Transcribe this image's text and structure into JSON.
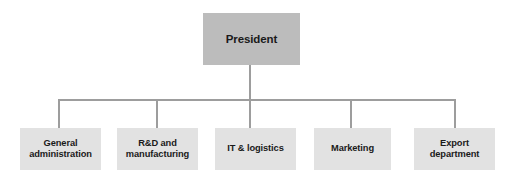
{
  "chart": {
    "type": "org-chart",
    "title": "",
    "background_color": "#ffffff",
    "line_color": "#9d9d9d",
    "root": {
      "id": "president",
      "label": "President",
      "fill_color": "#bcbcbc",
      "text_color": "#1a1a1a"
    },
    "departments": [
      {
        "id": "general-administration",
        "label": "General\nadministration",
        "fill_color": "#e2e2e2",
        "text_color": "#1a1a1a"
      },
      {
        "id": "rd-and-manufacturing",
        "label": "R&D and\nmanufacturing",
        "fill_color": "#e2e2e2",
        "text_color": "#1a1a1a"
      },
      {
        "id": "it-and-logistics",
        "label": "IT & logistics",
        "fill_color": "#e2e2e2",
        "text_color": "#1a1a1a"
      },
      {
        "id": "marketing",
        "label": "Marketing",
        "fill_color": "#e2e2e2",
        "text_color": "#1a1a1a"
      },
      {
        "id": "export-department",
        "label": "Export\ndepartment",
        "fill_color": "#e2e2e2",
        "text_color": "#1a1a1a"
      }
    ]
  }
}
